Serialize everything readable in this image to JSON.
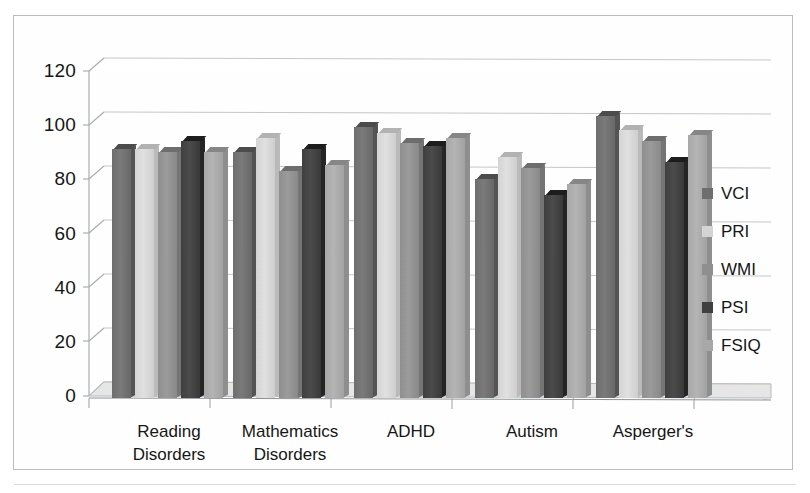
{
  "chart_data": {
    "type": "bar",
    "title": "",
    "subtitle": "",
    "xlabel": "",
    "ylabel": "",
    "categories": [
      "Reading Disorders",
      "Mathematics Disorders",
      "ADHD",
      "Autism",
      "Asperger's"
    ],
    "category_lines": [
      [
        "Reading",
        "Disorders"
      ],
      [
        "Mathematics",
        "Disorders"
      ],
      [
        "ADHD",
        ""
      ],
      [
        "Autism",
        ""
      ],
      [
        "Asperger's",
        ""
      ]
    ],
    "series": [
      {
        "name": "VCI",
        "color": "#6e6e6e",
        "values": [
          92,
          91,
          100,
          81,
          104
        ]
      },
      {
        "name": "PRI",
        "color": "#d4d4d4",
        "values": [
          92,
          96,
          98,
          89,
          99
        ]
      },
      {
        "name": "WMI",
        "color": "#8f8f8f",
        "values": [
          91,
          84,
          94,
          85,
          95
        ]
      },
      {
        "name": "PSI",
        "color": "#3f3f3f",
        "values": [
          95,
          92,
          93,
          75,
          87
        ]
      },
      {
        "name": "FSIQ",
        "color": "#a8a8a8",
        "values": [
          91,
          86,
          96,
          79,
          97
        ]
      }
    ],
    "ylim": [
      0,
      120
    ],
    "yticks": [
      0,
      20,
      40,
      60,
      80,
      100,
      120
    ],
    "ytick_labels": [
      "0",
      "20",
      "40",
      "60",
      "80",
      "100",
      "120"
    ],
    "grid": true,
    "legend_position": "right",
    "style": "3d-column"
  },
  "legend": {
    "entries": [
      {
        "label": "VCI",
        "color": "#6e6e6e"
      },
      {
        "label": "PRI",
        "color": "#d4d4d4"
      },
      {
        "label": "WMI",
        "color": "#8f8f8f"
      },
      {
        "label": "PSI",
        "color": "#3f3f3f"
      },
      {
        "label": "FSIQ",
        "color": "#a8a8a8"
      }
    ]
  },
  "colors": {
    "frame_border": "#b9bdc2",
    "gridline": "#c3c7cb",
    "axis": "#a9adb1",
    "text": "#161616",
    "background": "#ffffff",
    "floor": "#e2e2e2"
  }
}
